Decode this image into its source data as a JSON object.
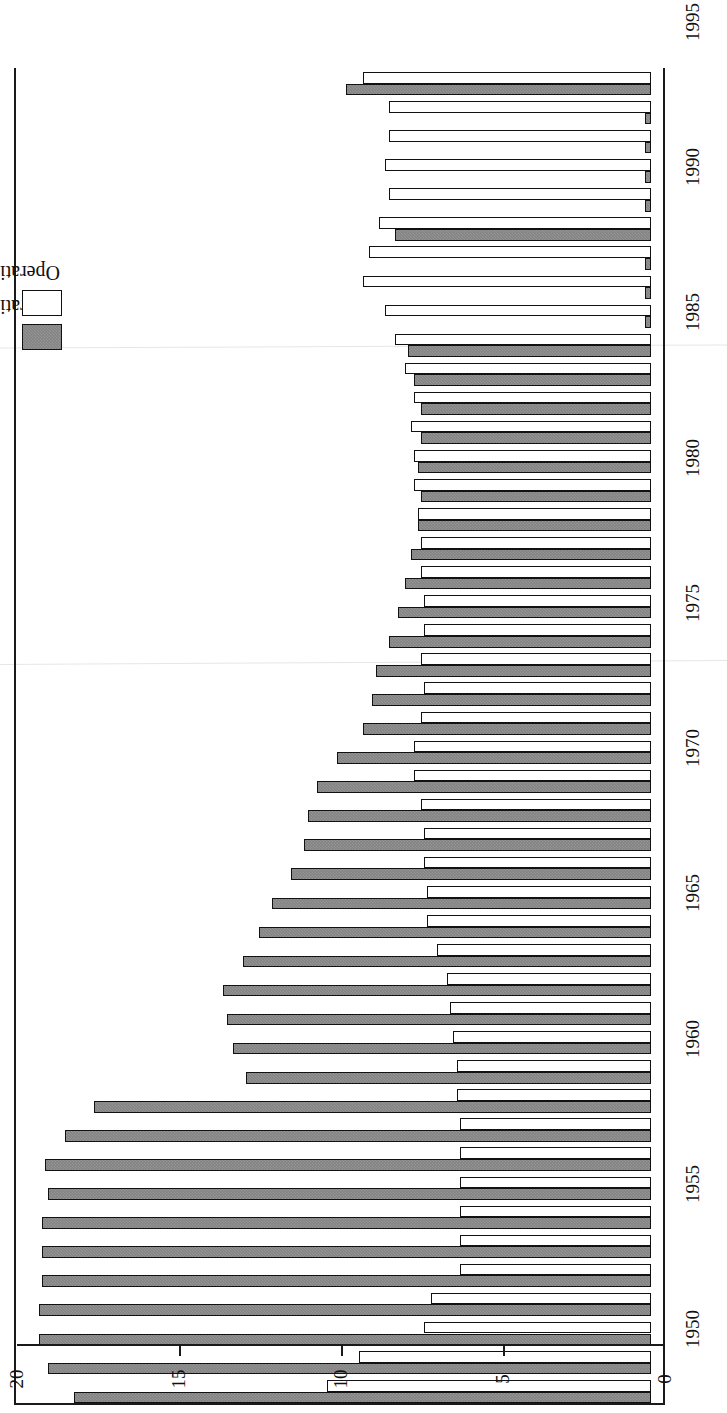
{
  "chart": {
    "type": "bar",
    "orientation": "horizontal-rotated",
    "title": "",
    "xlabel": "",
    "ylabel": "",
    "value_axis": {
      "min": 0,
      "max": 20,
      "ticks": [
        0,
        5,
        10,
        15,
        20
      ],
      "tick_labels": [
        "0",
        "5",
        "10",
        "15",
        "20"
      ],
      "direction": "right-to-left"
    },
    "category_axis": {
      "label_ticks": [
        1950,
        1955,
        1960,
        1965,
        1970,
        1975,
        1980,
        1985,
        1990,
        1995
      ],
      "label_text": [
        "1950",
        "1955",
        "1960",
        "1965",
        "1970",
        "1975",
        "1980",
        "1985",
        "1990",
        "1995"
      ]
    },
    "legend": {
      "position": "top-left",
      "entries": [
        {
          "label": "Operating expense",
          "swatch": "expense",
          "color": "#838383"
        },
        {
          "label": "Operating revenue",
          "swatch": "revenue",
          "color": "#ffffff"
        }
      ]
    }
  },
  "chart_data": {
    "type": "bar",
    "title": "",
    "xlabel": "",
    "ylabel": "",
    "ylim": [
      0,
      20
    ],
    "grid": false,
    "legend_position": "top-left",
    "categories": [
      "1950",
      "1951",
      "1952",
      "1953",
      "1954",
      "1955",
      "1956",
      "1957",
      "1958",
      "1959",
      "1960",
      "1961",
      "1962",
      "1963",
      "1964",
      "1965",
      "1966",
      "1967",
      "1968",
      "1969",
      "1970",
      "1971",
      "1972",
      "1973",
      "1974",
      "1975",
      "1976",
      "1977",
      "1978",
      "1979",
      "1980",
      "1981",
      "1982",
      "1983",
      "1984",
      "1985",
      "1986",
      "1987",
      "1988",
      "1989",
      "1990",
      "1991",
      "1992",
      "1993",
      "1994",
      "1995"
    ],
    "series": [
      {
        "name": "Operating revenue",
        "color": "#ffffff",
        "values": [
          8.9,
          8.1,
          8.1,
          8.2,
          8.1,
          8.4,
          8.7,
          8.9,
          8.2,
          7.9,
          7.6,
          7.3,
          7.4,
          7.3,
          7.3,
          7.2,
          7.1,
          7.1,
          7.0,
          7.0,
          7.1,
          7.0,
          7.1,
          7.3,
          7.3,
          7.1,
          7.0,
          7.0,
          6.9,
          6.9,
          6.6,
          6.3,
          6.2,
          6.1,
          6.0,
          6.0,
          5.9,
          5.9,
          5.9,
          5.9,
          5.9,
          5.9,
          6.8,
          7.0,
          9.0,
          10.0
        ]
      },
      {
        "name": "Operating expense",
        "color": "#838383",
        "values": [
          9.4,
          0.2,
          0.2,
          0.2,
          0.2,
          7.9,
          0.2,
          0.2,
          0.2,
          7.5,
          7.3,
          7.1,
          7.1,
          7.2,
          7.1,
          7.2,
          7.4,
          7.6,
          7.8,
          8.1,
          8.5,
          8.6,
          8.9,
          9.7,
          10.3,
          10.6,
          10.7,
          11.1,
          11.7,
          12.1,
          12.6,
          13.2,
          13.1,
          12.9,
          12.5,
          17.2,
          18.1,
          18.7,
          18.6,
          18.8,
          18.8,
          18.8,
          18.9,
          18.9,
          18.6,
          17.8
        ]
      }
    ]
  }
}
